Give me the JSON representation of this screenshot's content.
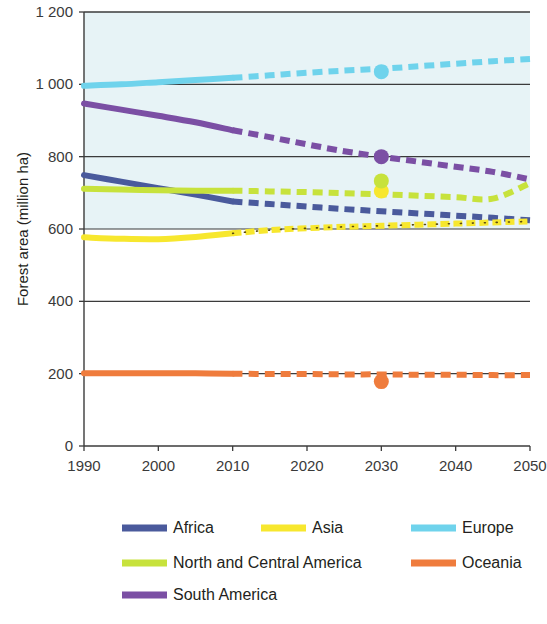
{
  "chart_data": {
    "type": "line",
    "title": "",
    "subtitle": "",
    "xlabel": "",
    "ylabel": "Forest area (million ha)",
    "xlim": [
      1990,
      2050
    ],
    "ylim": [
      0,
      1200
    ],
    "grid": true,
    "gridlines_y": [
      0,
      200,
      400,
      600,
      800,
      1000,
      1200
    ],
    "x_ticks": [
      1990,
      2000,
      2010,
      2020,
      2030,
      2040,
      2050
    ],
    "x_tick_labels": [
      "1990",
      "2000",
      "2010",
      "2020",
      "2030",
      "2040",
      "2050"
    ],
    "y_ticks": [
      0,
      200,
      400,
      600,
      800,
      1000,
      1200
    ],
    "y_tick_labels": [
      "0",
      "200",
      "400",
      "600",
      "800",
      "1 000",
      "1 200"
    ],
    "legend_position": "bottom",
    "historical_range": [
      1990,
      2010
    ],
    "projection_range": [
      2010,
      2050
    ],
    "projection_style": "dashed",
    "marker_year": 2030,
    "plot_background_upper": "#e7f3f6",
    "plot_background_lower": "#ffffff",
    "x": [
      1990,
      1995,
      2000,
      2005,
      2010,
      2015,
      2020,
      2025,
      2030,
      2035,
      2040,
      2045,
      2050
    ],
    "series": [
      {
        "name": "Africa",
        "color": "#4a5a9c",
        "values": [
          749,
          731,
          713,
          695,
          676,
          669,
          662,
          655,
          649,
          643,
          637,
          631,
          624
        ],
        "marker_2030": null
      },
      {
        "name": "Asia",
        "color": "#f7e72e",
        "values": [
          577,
          573,
          572,
          578,
          588,
          597,
          602,
          606,
          609,
          612,
          615,
          618,
          621
        ],
        "marker_2030": 705
      },
      {
        "name": "Europe",
        "color": "#6fd3ec",
        "values": [
          996,
          1000,
          1006,
          1012,
          1018,
          1025,
          1032,
          1038,
          1043,
          1050,
          1057,
          1064,
          1070
        ],
        "marker_2030": 1035
      },
      {
        "name": "North and Central America",
        "color": "#c7e23c",
        "values": [
          711,
          709,
          707,
          706,
          706,
          704,
          702,
          699,
          696,
          692,
          688,
          684,
          727
        ],
        "marker_2030": 733
      },
      {
        "name": "Oceania",
        "color": "#ef7c3d",
        "values": [
          201,
          201,
          201,
          201,
          200,
          199,
          199,
          198,
          198,
          197,
          197,
          196,
          196
        ],
        "marker_2030": 178
      },
      {
        "name": "South America",
        "color": "#7b4fa4",
        "values": [
          947,
          930,
          913,
          895,
          873,
          854,
          834,
          815,
          800,
          786,
          772,
          758,
          737
        ],
        "marker_2030": 800
      }
    ],
    "legend": [
      {
        "label": "Africa",
        "color": "#4a5a9c"
      },
      {
        "label": "Asia",
        "color": "#f7e72e"
      },
      {
        "label": "Europe",
        "color": "#6fd3ec"
      },
      {
        "label": "North and Central America",
        "color": "#c7e23c"
      },
      {
        "label": "Oceania",
        "color": "#ef7c3d"
      },
      {
        "label": "South America",
        "color": "#7b4fa4"
      }
    ]
  }
}
